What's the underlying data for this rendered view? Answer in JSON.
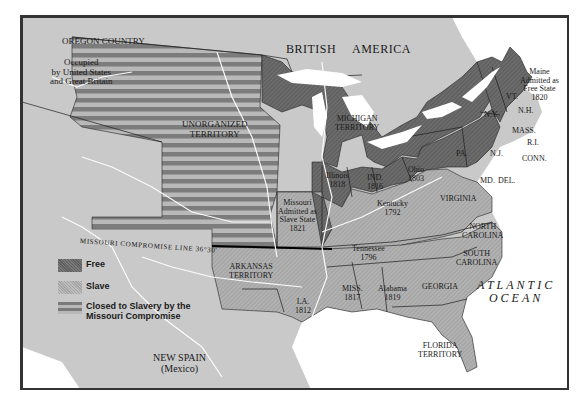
{
  "map": {
    "title_topic": "Missouri Compromise 1820",
    "compromise_line_label": "Missouri Compromise Line 36°30'",
    "colors": {
      "free": "#6e6e6e",
      "slave": "#b2b2b2",
      "closed_dark": "#7a7a7a",
      "closed_light": "#b8b8b8",
      "other_land": "#c8c8c8",
      "water": "#ffffff",
      "border": "#333333"
    },
    "regions": {
      "oregon": {
        "name": "Oregon Country",
        "note1": "Occupied",
        "note2": "by United States",
        "note3": "and Great Britain"
      },
      "british_america": {
        "word1": "British",
        "word2": "America"
      },
      "unorganized": {
        "line1": "Unorganized",
        "line2": "Territory"
      },
      "michigan": {
        "line1": "Michigan",
        "line2": "Territory"
      },
      "maine": {
        "name": "Maine",
        "note1": "Admitted as",
        "note2": "Free State",
        "year": "1820"
      },
      "vt": "VT.",
      "nh": "N.H.",
      "ny": "N.Y.",
      "mass": "MASS.",
      "ri": "R.I.",
      "conn": "CONN.",
      "pa": "PA.",
      "nj": "N.J.",
      "md": "MD.",
      "del": "DEL.",
      "illinois": {
        "name": "Illinois",
        "year": "1818"
      },
      "indiana": {
        "name": "IND.",
        "year": "1816"
      },
      "ohio": {
        "name": "Ohio",
        "year": "1803"
      },
      "missouri": {
        "name": "Missouri",
        "note1": "Admitted as",
        "note2": "Slave State",
        "year": "1821"
      },
      "kentucky": {
        "name": "Kentucky",
        "year": "1792"
      },
      "virginia": "Virginia",
      "tennessee": {
        "name": "Tennessee",
        "year": "1796"
      },
      "north_carolina": {
        "line1": "North",
        "line2": "Carolina"
      },
      "south_carolina": {
        "line1": "South",
        "line2": "Carolina"
      },
      "arkansas": {
        "line1": "Arkansas",
        "line2": "Territory"
      },
      "mississippi": {
        "name": "MISS.",
        "year": "1817"
      },
      "alabama": {
        "name": "Alabama",
        "year": "1819"
      },
      "georgia": "Georgia",
      "louisiana": {
        "name": "LA.",
        "year": "1812"
      },
      "florida": {
        "line1": "Florida",
        "line2": "Territory"
      },
      "new_spain": {
        "name": "NEW SPAIN",
        "note": "(Mexico)"
      },
      "atlantic": {
        "line1": "Atlantic",
        "line2": "Ocean"
      }
    }
  },
  "legend": {
    "items": [
      {
        "key": "free",
        "label": "Free"
      },
      {
        "key": "slave",
        "label": "Slave"
      },
      {
        "key": "closed",
        "label_line1": "Closed to Slavery by the",
        "label_line2": "Missouri Compromise"
      }
    ]
  }
}
